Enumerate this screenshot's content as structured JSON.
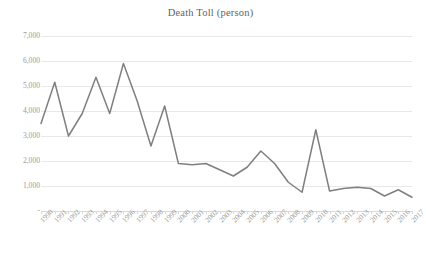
{
  "chart": {
    "title": "Death Toll (person)",
    "axis_color": "#d9d9d9",
    "grid_color": "#e8e8e8",
    "line_color": "#7f7f7f",
    "tick_text_color": "#9a9a9a",
    "title_text_color": "#636363"
  },
  "chart_data": {
    "type": "line",
    "title": "Death Toll (person)",
    "xlabel": "",
    "ylabel": "",
    "ylim": [
      0,
      7000
    ],
    "ytick_labels": [
      "7,000",
      "6,000",
      "5,000",
      "4,000",
      "3,000",
      "2,000",
      "1,000",
      "-"
    ],
    "ytick_values": [
      7000,
      6000,
      5000,
      4000,
      3000,
      2000,
      1000,
      0
    ],
    "grid": true,
    "legend": false,
    "categories": [
      "1990",
      "1991",
      "1992",
      "1993",
      "1994",
      "1995",
      "1996",
      "1997",
      "1998",
      "1999",
      "2000",
      "2001",
      "2002",
      "2003",
      "2004",
      "2005",
      "2006",
      "2007",
      "2008",
      "2009",
      "2010",
      "2011",
      "2012",
      "2013",
      "2014",
      "2015",
      "2016",
      "2017"
    ],
    "values": [
      3500,
      5150,
      3000,
      3900,
      5350,
      3900,
      5900,
      4400,
      2600,
      4200,
      1900,
      1850,
      1900,
      1650,
      1400,
      1750,
      2400,
      1900,
      1150,
      750,
      3250,
      800,
      900,
      950,
      900,
      600,
      850,
      550
    ]
  }
}
